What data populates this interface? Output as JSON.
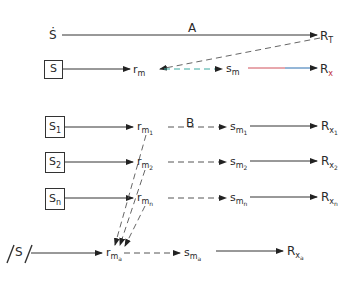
{
  "diagram": {
    "top": {
      "source_dot": "Ṡ",
      "path_label": "A",
      "target": "R",
      "target_sub": "T"
    },
    "single": {
      "source": "S",
      "r": "r",
      "r_sub": "m",
      "s": "s",
      "s_sub": "m",
      "R": "R",
      "R_sub": "x",
      "colors": {
        "dash_teal": "#3aa9a0",
        "line_red": "#d0505a",
        "line_blue": "#2a6fb0",
        "rx_sub": "#c0303a"
      }
    },
    "multi_label": "B",
    "rows": [
      {
        "source": "S",
        "source_sub": "1",
        "r_sub2": "1",
        "s_sub2": "1",
        "R_sub2": "1"
      },
      {
        "source": "S",
        "source_sub": "2",
        "r_sub2": "2",
        "s_sub2": "2",
        "R_sub2": "2"
      },
      {
        "source": "S",
        "source_sub": "n",
        "r_sub2": "n",
        "s_sub2": "n",
        "R_sub2": "n"
      }
    ],
    "aggregate": {
      "source": "S",
      "r_sub2": "a",
      "s_sub2": "a",
      "R_sub2": "a"
    },
    "sym": {
      "r": "r",
      "s": "s",
      "R": "R",
      "m": "m",
      "x": "x"
    }
  }
}
